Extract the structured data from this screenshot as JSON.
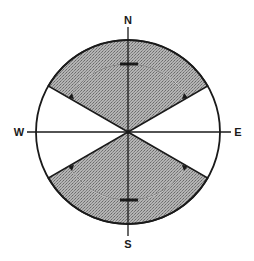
{
  "diagram": {
    "type": "compass-sector-diagram",
    "labels": {
      "north": "N",
      "south": "S",
      "west": "W",
      "east": "E"
    },
    "colors": {
      "line": "#1a1a1a",
      "shaded_fill": "#a8a8a8",
      "background": "#ffffff"
    },
    "sectors": [
      {
        "name": "north-sector",
        "start_deg": 30,
        "end_deg": 150,
        "shaded": true
      },
      {
        "name": "south-sector",
        "start_deg": 210,
        "end_deg": 330,
        "shaded": true
      },
      {
        "name": "east-sector",
        "start_deg": -30,
        "end_deg": 30,
        "shaded": false
      },
      {
        "name": "west-sector",
        "start_deg": 150,
        "end_deg": 210,
        "shaded": false
      }
    ],
    "inner_arcs": [
      {
        "name": "north-swing-arc",
        "description": "arc with arrows pointing toward sector edges from north"
      },
      {
        "name": "south-swing-arc",
        "description": "arc with arrows pointing toward sector edges from south"
      }
    ]
  }
}
